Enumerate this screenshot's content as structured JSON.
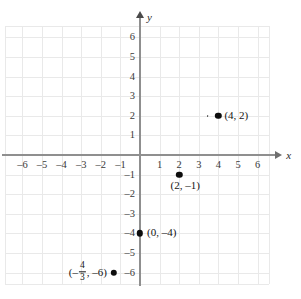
{
  "chart_data": {
    "type": "scatter",
    "title": "",
    "xlabel": "x",
    "ylabel": "y",
    "xlim": [
      -6.6,
      6.6
    ],
    "ylim": [
      -6.6,
      6.6
    ],
    "grid": true,
    "legend": "none",
    "x_ticks": [
      "-6",
      "-5",
      "-4",
      "-3",
      "-2",
      "-1",
      "1",
      "2",
      "3",
      "4",
      "5",
      "6"
    ],
    "x_tick_values": [
      -6,
      -5,
      -4,
      -3,
      -2,
      -1,
      1,
      2,
      3,
      4,
      5,
      6
    ],
    "y_ticks": [
      "6",
      "5",
      "4",
      "3",
      "2",
      "1",
      "-1",
      "-2",
      "-3",
      "-4",
      "-5",
      "-6"
    ],
    "y_tick_values": [
      6,
      5,
      4,
      3,
      2,
      1,
      -1,
      -2,
      -3,
      -4,
      -5,
      -6
    ],
    "points": [
      {
        "x": 4,
        "y": 2,
        "label": "(4, 2)"
      },
      {
        "x": 2,
        "y": -1,
        "label": "(2, –1)"
      },
      {
        "x": 0,
        "y": -4,
        "label": "(0, –4)"
      },
      {
        "x": -1.3333,
        "y": -6,
        "label": "(– 4/3 , –6)"
      }
    ],
    "annotations": [
      {
        "text": "speck near (4, 2)",
        "x": 3.45,
        "y": 2.0
      }
    ]
  },
  "axes": {
    "x_label": "x",
    "y_label": "y"
  },
  "ticks": {
    "x": [
      {
        "label": "–6",
        "v": -6
      },
      {
        "label": "–5",
        "v": -5
      },
      {
        "label": "–4",
        "v": -4
      },
      {
        "label": "–3",
        "v": -3
      },
      {
        "label": "–2",
        "v": -2
      },
      {
        "label": "–1",
        "v": -1
      },
      {
        "label": "1",
        "v": 1
      },
      {
        "label": "2",
        "v": 2
      },
      {
        "label": "3",
        "v": 3
      },
      {
        "label": "4",
        "v": 4
      },
      {
        "label": "5",
        "v": 5
      },
      {
        "label": "6",
        "v": 6
      }
    ],
    "y": [
      {
        "label": "6",
        "v": 6
      },
      {
        "label": "5",
        "v": 5
      },
      {
        "label": "4",
        "v": 4
      },
      {
        "label": "3",
        "v": 3
      },
      {
        "label": "2",
        "v": 2
      },
      {
        "label": "1",
        "v": 1
      },
      {
        "label": "–1",
        "v": -1
      },
      {
        "label": "–2",
        "v": -2
      },
      {
        "label": "–3",
        "v": -3
      },
      {
        "label": "–4",
        "v": -4
      },
      {
        "label": "–5",
        "v": -5
      },
      {
        "label": "–6",
        "v": -6
      }
    ]
  },
  "point_labels": {
    "p1": "(4, 2)",
    "p2": "(2, –1)",
    "p3": "(0, –4)",
    "p4_open": "(–",
    "p4_num": "4",
    "p4_den": "3",
    "p4_close": ", –6)"
  },
  "colors": {
    "grid": "#e9e9e9",
    "axis": "#8f8f8f",
    "point": "#0d0d0d",
    "text": "#141414",
    "background": "#ffffff"
  }
}
